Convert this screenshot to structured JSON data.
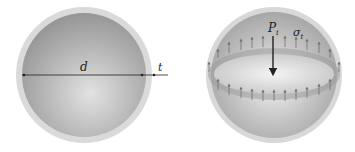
{
  "figure": {
    "left_sphere": {
      "labels": {
        "diameter": "d",
        "thickness": "t"
      }
    },
    "right_sphere": {
      "labels": {
        "pressure": "P",
        "pressure_sub": "i",
        "stress": "σ",
        "stress_sub": "t"
      }
    }
  },
  "colors": {
    "shell": "#d6d6d6",
    "interior_dark": "#8c8c8c",
    "interior_light": "#e6e6e6",
    "line": "#222222",
    "stress_arrow": "#7a6a6a"
  }
}
